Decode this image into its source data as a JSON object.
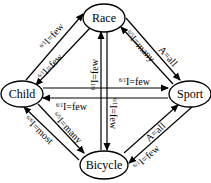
{
  "diagram": {
    "type": "directed-graph",
    "nodes": {
      "race": {
        "label": "Race"
      },
      "child": {
        "label": "Child"
      },
      "sport": {
        "label": "Sport"
      },
      "bicycle": {
        "label": "Bicycle"
      }
    },
    "edges": [
      {
        "id": "child_race",
        "from": "Child",
        "to": "Race",
        "sup": "6/1",
        "label": "I=few"
      },
      {
        "id": "race_child",
        "from": "Race",
        "to": "Child",
        "sup": "6/1",
        "label": "I=few"
      },
      {
        "id": "bicycle_race",
        "from": "Bicycle",
        "to": "Race",
        "sup": "6/1",
        "label": "I=few"
      },
      {
        "id": "race_bicycle",
        "from": "Race",
        "to": "Bicycle",
        "sup": "6/1",
        "label": "I=few"
      },
      {
        "id": "sport_race",
        "from": "Sport",
        "to": "Race",
        "sup": "6/5",
        "label": "I=many"
      },
      {
        "id": "race_sport",
        "from": "Race",
        "to": "Sport",
        "sup": "",
        "label": "A=all"
      },
      {
        "id": "child_sport",
        "from": "Child",
        "to": "Sport",
        "sup": "6/1",
        "label": "I=few"
      },
      {
        "id": "sport_child",
        "from": "Sport",
        "to": "Child",
        "sup": "6/1",
        "label": "I=few"
      },
      {
        "id": "child_bicycle",
        "from": "Child",
        "to": "Bicycle",
        "sup": "6/5",
        "label": "I=many"
      },
      {
        "id": "bicycle_child",
        "from": "Bicycle",
        "to": "Child",
        "sup": "6/6",
        "label": "I=most"
      },
      {
        "id": "bicycle_sport",
        "from": "Bicycle",
        "to": "Sport",
        "sup": "",
        "label": "A=all"
      },
      {
        "id": "sport_bicycle",
        "from": "Sport",
        "to": "Bicycle",
        "sup": "6/1",
        "label": "I=few"
      }
    ],
    "labels": {
      "child_race": {
        "sup": "6/1",
        "text": "I=few"
      },
      "race_child": {
        "sup": "6/1",
        "text": "I=few"
      },
      "bicycle_race": {
        "sup": "6/1",
        "text": "I=few"
      },
      "race_bicycle": {
        "sup": "6/1",
        "text": "I=few"
      },
      "sport_race": {
        "sup": "6/5",
        "text": "I=many"
      },
      "race_sport": {
        "text": "A=all"
      },
      "child_sport": {
        "sup": "6/1",
        "text": "I=few"
      },
      "sport_child": {
        "sup": "6/1",
        "text": "I=few"
      },
      "child_bicycle": {
        "sup": "6/5",
        "text": "I=many"
      },
      "bicycle_child": {
        "sup": "6/6",
        "text": "I=most"
      },
      "bicycle_sport": {
        "text": "A=all"
      },
      "sport_bicycle": {
        "sup": "6/1",
        "text": "I=few"
      }
    },
    "colors": {
      "stroke": "#000000",
      "background": "#ffffff"
    }
  }
}
